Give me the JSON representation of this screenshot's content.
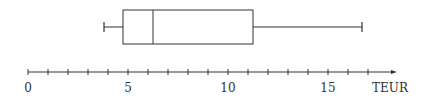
{
  "chart_data": {
    "type": "boxplot",
    "title": "",
    "xlabel": "TEUR",
    "ylabel": "",
    "xlim": [
      0,
      17
    ],
    "tick_labels": [
      "0",
      "5",
      "10",
      "15"
    ],
    "minor_ticks": [
      0,
      1,
      2,
      3,
      4,
      5,
      6,
      7,
      8,
      9,
      10,
      11,
      12,
      13,
      14,
      15,
      16,
      17
    ],
    "grid": false,
    "legend": null,
    "box": {
      "min": 3.8,
      "q1": 4.75,
      "median": 6.25,
      "q3": 11.25,
      "max": 16.7
    }
  },
  "axis": {
    "unit_label": "TEUR",
    "labels": [
      {
        "text": "0",
        "value": 0
      },
      {
        "text": "5",
        "value": 5
      },
      {
        "text": "10",
        "value": 10
      },
      {
        "text": "15",
        "value": 15
      }
    ]
  },
  "colors": {
    "stroke": "#333333",
    "background": "#ffffff"
  }
}
